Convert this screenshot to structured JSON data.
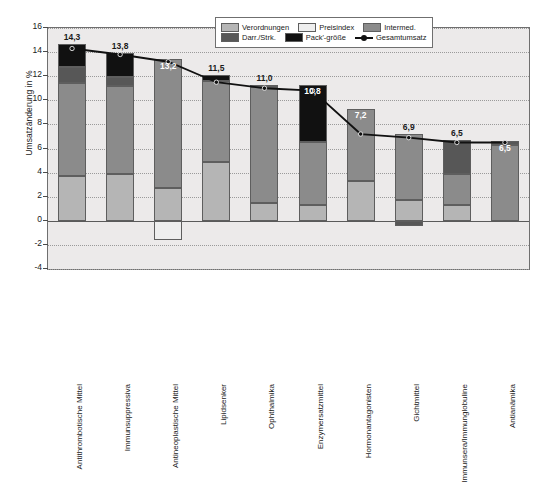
{
  "chart_data": {
    "type": "bar",
    "title": "",
    "xlabel": "",
    "ylabel": "Umsatzänderung in %",
    "ylim": [
      -4,
      16
    ],
    "yticks": [
      -4,
      -2,
      0,
      2,
      4,
      6,
      8,
      10,
      12,
      14,
      16
    ],
    "ytick_labels": [
      "-4",
      "-2",
      "0",
      "2",
      "4",
      "6",
      "8",
      "10",
      "12",
      "14",
      "16"
    ],
    "grid": true,
    "legend_position": "top-right",
    "stacked": true,
    "categories": [
      "Antithrombotische Mittel",
      "Immunsuppressiva",
      "Antineoplastische Mittel",
      "Lipidsenker",
      "Ophthalmika",
      "Enzymersatzmittel",
      "Hormonantagonisten",
      "Gichtmittel",
      "Immunsera/Immunglobuline",
      "Antianämika"
    ],
    "series": [
      {
        "name": "Verordnungen",
        "color": "#b5b5b5",
        "values": [
          3.7,
          3.9,
          2.7,
          4.9,
          1.5,
          1.3,
          3.3,
          1.7,
          1.3,
          0.0
        ]
      },
      {
        "name": "Preisindex",
        "color": "#eeeeee",
        "values": [
          0.0,
          0.0,
          -1.6,
          0.0,
          0.0,
          0.0,
          0.0,
          0.0,
          0.0,
          0.0
        ]
      },
      {
        "name": "Intermed.",
        "color": "#8b8b8b",
        "values": [
          7.7,
          7.3,
          10.7,
          6.7,
          9.6,
          5.2,
          6.0,
          5.5,
          2.6,
          6.3
        ]
      },
      {
        "name": "Darr./Strk.",
        "color": "#575757",
        "values": [
          1.4,
          0.7,
          0.0,
          0.0,
          0.2,
          0.0,
          0.0,
          -0.4,
          2.8,
          0.3
        ]
      },
      {
        "name": "Pack'-größe",
        "color": "#111111",
        "values": [
          1.9,
          2.0,
          0.0,
          0.5,
          0.0,
          4.8,
          0.0,
          0.0,
          0.0,
          0.0
        ]
      }
    ],
    "line_series": {
      "name": "Gesamtumsatz",
      "color": "#111111",
      "values": [
        14.3,
        13.8,
        13.2,
        11.5,
        11.0,
        10.8,
        7.2,
        6.9,
        6.5,
        6.5
      ]
    },
    "value_labels": [
      "14,3",
      "13,8",
      "13,2",
      "11,5",
      "11,0",
      "10,8",
      "7,2",
      "6,9",
      "6,5",
      "6,5"
    ]
  },
  "legend": {
    "items": [
      {
        "label": "Verordnungen",
        "kind": "swatch",
        "swatch": "verordnungen"
      },
      {
        "label": "Preisindex",
        "kind": "swatch",
        "swatch": "preisindex"
      },
      {
        "label": "Intermed.",
        "kind": "swatch",
        "swatch": "intermed"
      },
      {
        "label": "Darr./Strk.",
        "kind": "swatch",
        "swatch": "darr"
      },
      {
        "label": "Pack'-größe",
        "kind": "swatch",
        "swatch": "pack"
      },
      {
        "label": "Gesamtumsatz",
        "kind": "line",
        "swatch": "line"
      }
    ]
  }
}
